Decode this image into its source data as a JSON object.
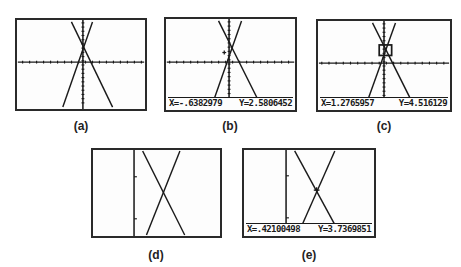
{
  "figure": {
    "panels": [
      {
        "id": "a",
        "caption": "(a)",
        "has_readout": false,
        "cursor": "none"
      },
      {
        "id": "b",
        "caption": "(b)",
        "has_readout": true,
        "cursor": "plus",
        "readout": {
          "x": "X=-.6382979",
          "y": "Y=2.5806452"
        }
      },
      {
        "id": "c",
        "caption": "(c)",
        "has_readout": true,
        "cursor": "zoom-box",
        "readout": {
          "x": "X=1.2765957",
          "y": "Y=4.516129"
        }
      },
      {
        "id": "d",
        "caption": "(d)",
        "has_readout": false,
        "cursor": "none"
      },
      {
        "id": "e",
        "caption": "(e)",
        "has_readout": true,
        "cursor": "plus",
        "readout": {
          "x": "X=.42100498",
          "y": "Y=3.7369851"
        }
      }
    ],
    "colors": {
      "frame": "#2a2a2a",
      "ink": "#1a1a1a",
      "background": "#ffffff"
    }
  }
}
